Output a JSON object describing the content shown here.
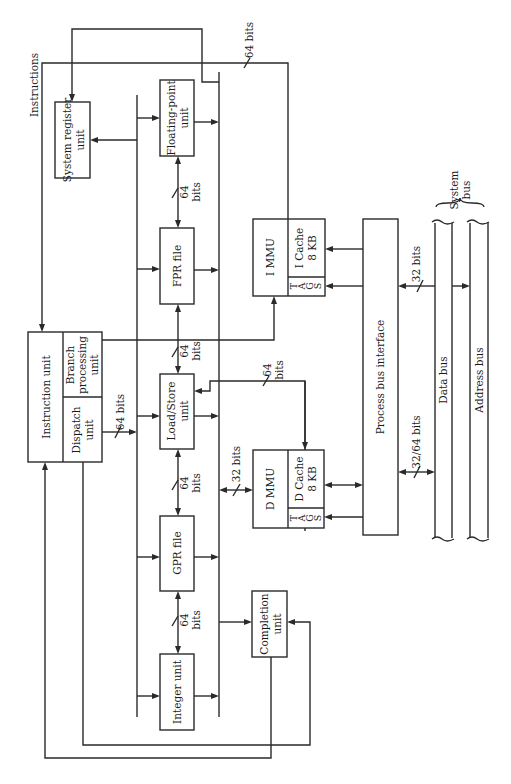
{
  "diagram": {
    "orientation": "rotated-90-ccw",
    "units": {
      "instruction_unit": "Instruction unit",
      "branch_unit_line1": "Branch",
      "branch_unit_line2": "processing",
      "branch_unit_line3": "unit",
      "dispatch_unit_line1": "Dispatch",
      "dispatch_unit_line2": "unit",
      "system_register_line1": "System register",
      "system_register_line2": "unit",
      "floating_point_line1": "Floating-point",
      "floating_point_line2": "unit",
      "fpr_file": "FPR file",
      "load_store_line1": "Load/Store",
      "load_store_line2": "unit",
      "gpr_file": "GPR file",
      "integer_unit": "Integer unit",
      "completion_line1": "Completion",
      "completion_line2": "unit",
      "immu": "I MMU",
      "icache_line1": "I Cache",
      "icache_line2": "8 KB",
      "dmmu": "D MMU",
      "dcache_line1": "D Cache",
      "dcache_line2": "8 KB",
      "tags": [
        "T",
        "A",
        "G",
        "S"
      ],
      "process_bus_interface": "Process bus interface",
      "data_bus": "Data bus",
      "address_bus": "Address bus",
      "system_bus_line1": "System",
      "system_bus_line2": "bus"
    },
    "labels": {
      "instructions": "Instructions",
      "top_64_bits": "64 bits",
      "fp_fpr_64": "64",
      "fp_fpr_bits": "bits",
      "fpr_ls_64": "64",
      "fpr_ls_bits": "bits",
      "dispatch_64_bits": "64 bits",
      "ls_gpr_64": "64",
      "ls_gpr_bits": "bits",
      "gpr_int_64": "64",
      "gpr_int_bits": "bits",
      "ls_dcache_64": "64",
      "ls_dcache_bits": "bits",
      "bus_dmmu_32_bits": "32 bits",
      "sysbus_32_bits": "32 bits",
      "sysbus_3264_bits": "32/64 bits"
    }
  }
}
